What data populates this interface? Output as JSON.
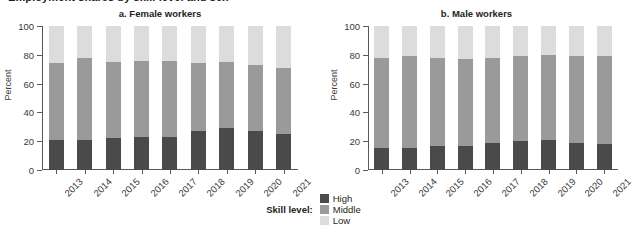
{
  "main_title_clipped": "Employment shares by skill level and sex",
  "legend": {
    "title": "Skill level:",
    "items": [
      {
        "label": "High",
        "color": "#4a4a4a"
      },
      {
        "label": "Middle",
        "color": "#9a9a9a"
      },
      {
        "label": "Low",
        "color": "#dcdcdc"
      }
    ]
  },
  "chart_data": [
    {
      "type": "bar",
      "title": "a. Female workers",
      "subplot": "a",
      "stacked": true,
      "xlabel": "",
      "ylabel": "Percent",
      "ylim": [
        0,
        100
      ],
      "yticks": [
        0,
        20,
        40,
        60,
        80,
        100
      ],
      "grid": false,
      "legend_position": "bottom-center",
      "categories": [
        "2013",
        "2014",
        "2015",
        "2016",
        "2017",
        "2018",
        "2019",
        "2020",
        "2021"
      ],
      "series": [
        {
          "name": "High",
          "color": "#4a4a4a",
          "values": [
            21,
            21,
            22,
            23,
            23,
            27,
            29,
            27,
            25
          ]
        },
        {
          "name": "Middle",
          "color": "#9a9a9a",
          "values": [
            53,
            57,
            53,
            53,
            53,
            47,
            46,
            46,
            46
          ]
        },
        {
          "name": "Low",
          "color": "#dcdcdc",
          "values": [
            26,
            22,
            25,
            24,
            24,
            26,
            25,
            27,
            29
          ]
        }
      ],
      "cumulative_tops": {
        "high": [
          21,
          21,
          22,
          23,
          23,
          27,
          29,
          27,
          25
        ],
        "high_middle": [
          74,
          78,
          75,
          76,
          76,
          74,
          75,
          73,
          71
        ]
      }
    },
    {
      "type": "bar",
      "title": "b. Male workers",
      "subplot": "b",
      "stacked": true,
      "xlabel": "",
      "ylabel": "Percent",
      "ylim": [
        0,
        100
      ],
      "yticks": [
        0,
        20,
        40,
        60,
        80,
        100
      ],
      "grid": false,
      "legend_position": "bottom-center",
      "categories": [
        "2013",
        "2014",
        "2015",
        "2016",
        "2017",
        "2018",
        "2019",
        "2020",
        "2021"
      ],
      "series": [
        {
          "name": "High",
          "color": "#4a4a4a",
          "values": [
            15,
            15,
            17,
            17,
            19,
            20,
            21,
            19,
            18
          ]
        },
        {
          "name": "Middle",
          "color": "#9a9a9a",
          "values": [
            63,
            64,
            61,
            60,
            59,
            59,
            59,
            60,
            61
          ]
        },
        {
          "name": "Low",
          "color": "#dcdcdc",
          "values": [
            22,
            21,
            22,
            23,
            22,
            21,
            20,
            21,
            21
          ]
        }
      ],
      "cumulative_tops": {
        "high": [
          15,
          15,
          17,
          17,
          19,
          20,
          21,
          19,
          18
        ],
        "high_middle": [
          78,
          79,
          78,
          77,
          78,
          79,
          80,
          79,
          79
        ]
      }
    }
  ]
}
